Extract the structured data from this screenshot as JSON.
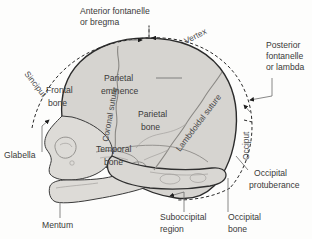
{
  "figure": {
    "background_color": "#fdfdfc",
    "bone_fill_color": "#d9d7d3",
    "outline_color": "#2b2b2b",
    "label_color": "#3a3a3a"
  },
  "labels": {
    "anterior_fontanelle": "Anterior fontanelle",
    "anterior_fontanelle_line2": "or bregma",
    "vertex": "Vertex",
    "posterior_fontanelle": "Posterior",
    "posterior_fontanelle_line2": "fontanelle",
    "posterior_fontanelle_line3": "or lambda",
    "sinciput": "Sinciput",
    "occiput": "Occiput",
    "frontal_bone": "Frontal",
    "frontal_bone_line2": "bone",
    "coronal_suture": "Coronal suture",
    "parietal_eminence": "Parietal",
    "parietal_eminence_line2": "eminence",
    "parietal_bone": "Parietal",
    "parietal_bone_line2": "bone",
    "lambdoidal_suture": "Lambdoidal suture",
    "temporal_bone": "Temporal",
    "temporal_bone_line2": "bone",
    "glabella": "Glabella",
    "mentum": "Mentum",
    "suboccipital_region": "Suboccipital",
    "suboccipital_region_line2": "region",
    "occipital_bone": "Occipital",
    "occipital_bone_line2": "bone",
    "occipital_protuberance": "Occipital",
    "occipital_protuberance_line2": "protuberance"
  }
}
